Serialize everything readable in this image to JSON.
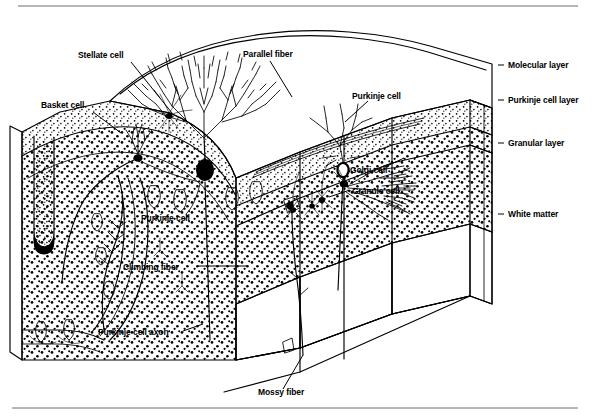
{
  "figure": {
    "domain": "diagram",
    "style": "black and white line drawing with stipple shading",
    "background_color": "#ffffff",
    "ink_color": "#000000",
    "rule_color": "#4a4a4a"
  },
  "rules": {
    "top_rule_y": 6,
    "bottom_rule_y": 408
  },
  "labels": [
    {
      "id": "stellate-cell",
      "text": "Stellate cell",
      "x": 78,
      "y": 58,
      "anchor": "start"
    },
    {
      "id": "basket-cell",
      "text": "Basket cell",
      "x": 41,
      "y": 108,
      "anchor": "start"
    },
    {
      "id": "parallel-fiber",
      "text": "Parallel fiber",
      "x": 243,
      "y": 57,
      "anchor": "start"
    },
    {
      "id": "purkinje-cell-right",
      "text": "Purkinje cell",
      "x": 352,
      "y": 99,
      "anchor": "start"
    },
    {
      "id": "purkinje-cell-left",
      "text": "Purkinje cell",
      "x": 141,
      "y": 221,
      "anchor": "start"
    },
    {
      "id": "golgi-cell",
      "text": "Golgi cell",
      "x": 350,
      "y": 173,
      "anchor": "start"
    },
    {
      "id": "granule-cell",
      "text": "Granule cell",
      "x": 352,
      "y": 194,
      "anchor": "start"
    },
    {
      "id": "climbing-fiber",
      "text": "Climbing fiber",
      "x": 123,
      "y": 270,
      "anchor": "start"
    },
    {
      "id": "purkinje-cell-axon",
      "text": "Purkinje cell axon",
      "x": 98,
      "y": 335,
      "anchor": "start"
    },
    {
      "id": "mossy-fiber",
      "text": "Mossy fiber",
      "x": 258,
      "y": 395,
      "anchor": "start"
    },
    {
      "id": "molecular-layer",
      "text": "Molecular layer",
      "x": 508,
      "y": 68,
      "anchor": "start"
    },
    {
      "id": "purkinje-cell-layer",
      "text": "Purkinje cell layer",
      "x": 508,
      "y": 103,
      "anchor": "start"
    },
    {
      "id": "granular-layer",
      "text": "Granular layer",
      "x": 508,
      "y": 146,
      "anchor": "start"
    },
    {
      "id": "white-matter",
      "text": "White matter",
      "x": 508,
      "y": 217,
      "anchor": "start"
    }
  ],
  "leaders": [
    {
      "id": "lead-stellate",
      "d": "M 131 62 L 172 113"
    },
    {
      "id": "lead-basket",
      "d": "M 93 112 L 121 133"
    },
    {
      "id": "lead-parallel",
      "d": "M 270 61 L 292 97"
    },
    {
      "id": "lead-purkinje-right",
      "d": "M 368 101 L 345 122"
    },
    {
      "id": "lead-golgi",
      "d": "M 385 167 L 404 158"
    },
    {
      "id": "lead-granule",
      "d": "M 350 190 L 329 197"
    },
    {
      "id": "lead-climbing",
      "d": "M 198 266 L 247 266"
    },
    {
      "id": "lead-axon",
      "d": "M 183 331 L 203 324"
    },
    {
      "id": "lead-mossy",
      "d": "M 283 389 L 303 355"
    },
    {
      "id": "tick-molecular",
      "d": "M 498 65 L 504 65"
    },
    {
      "id": "tick-purkinje-layer",
      "d": "M 498 100 L 504 100"
    },
    {
      "id": "tick-granular",
      "d": "M 498 143 L 504 143"
    },
    {
      "id": "tick-white",
      "d": "M 498 214 L 504 214"
    }
  ],
  "layers": {
    "names": [
      "Molecular layer",
      "Purkinje cell layer",
      "Granular layer",
      "White matter"
    ],
    "order_top_to_bottom": true
  },
  "cell_types": [
    "Stellate cell",
    "Basket cell",
    "Purkinje cell",
    "Golgi cell",
    "Granule cell"
  ],
  "fiber_types": [
    "Parallel fiber",
    "Climbing fiber",
    "Mossy fiber",
    "Purkinje cell axon"
  ]
}
